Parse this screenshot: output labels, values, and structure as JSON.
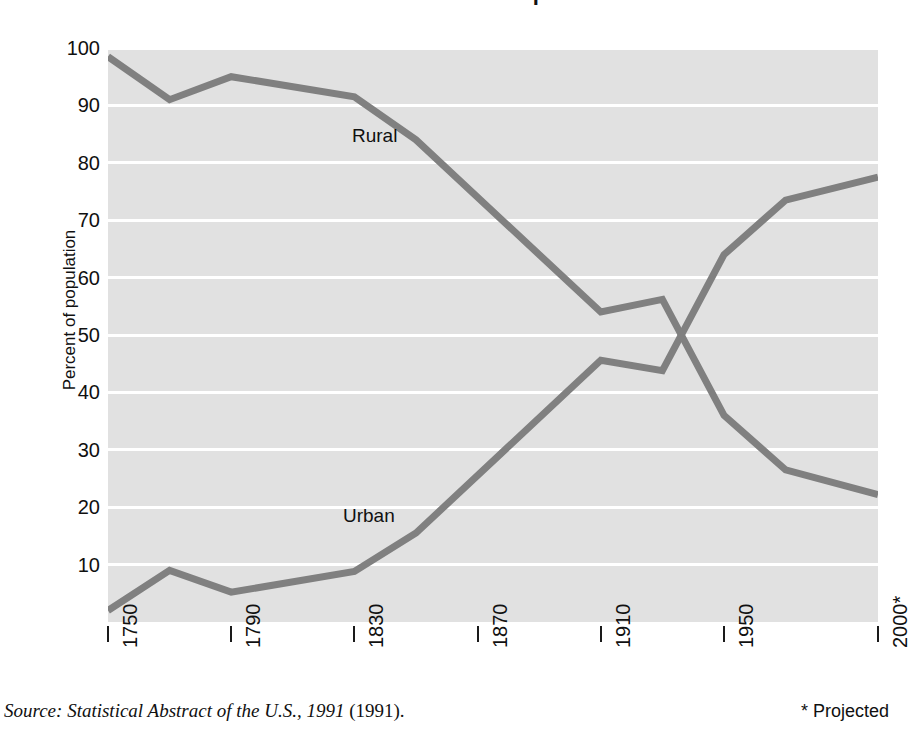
{
  "header": {
    "title_clipped": "U.S. Rural and Urban Population"
  },
  "axes": {
    "y_title": "Percent of population",
    "y_ticks": [
      "100",
      "90",
      "80",
      "70",
      "60",
      "50",
      "40",
      "30",
      "20",
      "10"
    ],
    "x_ticks": [
      "1750",
      "1790",
      "1830",
      "1870",
      "1910",
      "1950",
      "2000*"
    ]
  },
  "series_labels": {
    "rural": "Rural",
    "urban": "Urban"
  },
  "footer": {
    "source": "Source: Statistical Abstract of the U.S., 1991",
    "source_tail": " (1991).",
    "projected": "* Projected"
  },
  "colors": {
    "line": "#808080",
    "plot_background": "#e1e1e1",
    "gridline": "#ffffff",
    "text": "#101010"
  },
  "chart_data": {
    "type": "line",
    "title": "U.S. Rural and Urban Population",
    "xlabel": "",
    "ylabel": "Percent of population",
    "xlim": [
      1750,
      2000
    ],
    "ylim": [
      0,
      100
    ],
    "grid": true,
    "legend": "inline-labels",
    "x": [
      1750,
      1770,
      1790,
      1830,
      1850,
      1910,
      1930,
      1950,
      1970,
      2000
    ],
    "series": [
      {
        "name": "Rural",
        "color": "#808080",
        "values": [
          98.5,
          91.0,
          95.0,
          91.5,
          84.0,
          54.0,
          56.2,
          36.0,
          26.5,
          22.2
        ]
      },
      {
        "name": "Urban",
        "color": "#808080",
        "values": [
          2.0,
          9.0,
          5.2,
          8.8,
          15.5,
          45.6,
          43.8,
          64.0,
          73.5,
          77.5
        ]
      }
    ]
  }
}
